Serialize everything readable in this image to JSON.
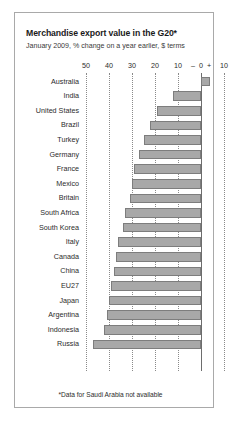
{
  "chart_data": {
    "type": "bar",
    "orientation": "horizontal",
    "title": "Merchandise export value in the G20*",
    "subtitle": "January 2009, % change on a year earlier, $ terms",
    "footnote": "*Data for Saudi Arabia not available",
    "xlabel": "",
    "ylabel": "",
    "xlim": [
      -50,
      10
    ],
    "grid": true,
    "legend": false,
    "axis_ticks": [
      {
        "value": -50,
        "label": "50"
      },
      {
        "value": -40,
        "label": "40"
      },
      {
        "value": -30,
        "label": "30"
      },
      {
        "value": -20,
        "label": "20"
      },
      {
        "value": -10,
        "label": "10"
      },
      {
        "value": 0,
        "label": "0"
      },
      {
        "value": 10,
        "label": "10"
      }
    ],
    "axis_sign_minus": "–",
    "axis_sign_plus": "+",
    "bar_color": "#a8a8a8",
    "bar_border_color": "#7d7d7d",
    "categories": [
      "Australia",
      "India",
      "United States",
      "Brazil",
      "Turkey",
      "Germany",
      "France",
      "Mexico",
      "Britain",
      "South Africa",
      "South Korea",
      "Italy",
      "Canada",
      "China",
      "EU27",
      "Japan",
      "Argentina",
      "Indonesia",
      "Russia"
    ],
    "values": [
      4,
      -12,
      -19,
      -22,
      -25,
      -27,
      -29,
      -30,
      -31,
      -33,
      -34,
      -36,
      -37,
      -38,
      -39,
      -40,
      -41,
      -42,
      -47
    ]
  }
}
